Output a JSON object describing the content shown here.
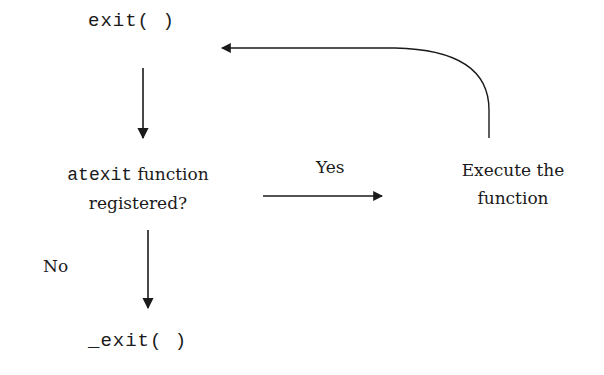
{
  "diagram": {
    "type": "flowchart",
    "nodes": {
      "exit_call": "exit( )",
      "check_keyword": "atexit",
      "check_rest": " function",
      "check_line2": "registered?",
      "execute_line1": "Execute the",
      "execute_line2": "function",
      "underscore_exit_call": "_exit( )"
    },
    "edges": {
      "yes_label": "Yes",
      "no_label": "No"
    },
    "connections": [
      {
        "from": "exit( )",
        "to": "atexit function registered?",
        "label": ""
      },
      {
        "from": "atexit function registered?",
        "to": "Execute the function",
        "label": "Yes"
      },
      {
        "from": "Execute the function",
        "to": "exit( )",
        "label": ""
      },
      {
        "from": "atexit function registered?",
        "to": "_exit( )",
        "label": "No"
      }
    ],
    "colors": {
      "background": "#ffffff",
      "ink": "#1a1a1a"
    }
  }
}
